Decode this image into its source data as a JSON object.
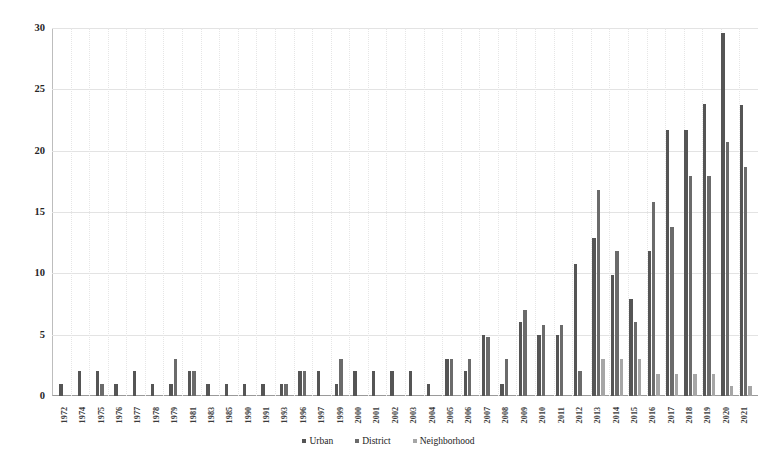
{
  "chart_data": {
    "type": "bar",
    "title": "",
    "xlabel": "",
    "ylabel": "",
    "ylim": [
      0,
      30
    ],
    "yticks": [
      0,
      5,
      10,
      15,
      20,
      25,
      30
    ],
    "grid": true,
    "legend_position": "bottom",
    "categories": [
      "1972",
      "1974",
      "1975",
      "1976",
      "1977",
      "1978",
      "1979",
      "1981",
      "1983",
      "1985",
      "1990",
      "1991",
      "1993",
      "1996",
      "1997",
      "1999",
      "2000",
      "2001",
      "2002",
      "2003",
      "2004",
      "2005",
      "2006",
      "2007",
      "2008",
      "2009",
      "2010",
      "2011",
      "2012",
      "2013",
      "2014",
      "2015",
      "2016",
      "2017",
      "2018",
      "2019",
      "2020",
      "2021"
    ],
    "series": [
      {
        "name": "Urban",
        "color": "#555555",
        "values": [
          1,
          2,
          2,
          1,
          2,
          1,
          1,
          2,
          1,
          1,
          1,
          1,
          1,
          2,
          2,
          1,
          2,
          2,
          2,
          2,
          1,
          3,
          2,
          5,
          1,
          6,
          5,
          5,
          10.8,
          12.9,
          9.9,
          7.9,
          11.8,
          21.7,
          21.7,
          23.8,
          29.6,
          23.7
        ]
      },
      {
        "name": "District",
        "color": "#6b6b6b",
        "values": [
          0,
          0,
          1,
          0,
          0,
          0,
          3,
          2,
          0,
          0,
          0,
          0,
          1,
          2,
          0,
          3,
          0,
          0,
          0,
          0,
          0,
          3,
          3,
          4.8,
          3,
          7,
          5.8,
          5.8,
          2,
          16.8,
          11.8,
          6,
          15.8,
          13.8,
          17.9,
          17.9,
          20.7,
          18.7
        ]
      },
      {
        "name": "Neighborhood",
        "color": "#a6a6a6",
        "values": [
          0,
          0,
          0,
          0,
          0,
          0,
          0,
          0,
          0,
          0,
          0,
          0,
          0,
          0,
          0,
          0,
          0,
          0,
          0,
          0,
          0,
          0,
          0,
          0,
          0,
          0,
          0,
          0,
          0,
          3,
          3,
          3,
          1.8,
          1.8,
          1.8,
          1.8,
          0.8,
          0.8
        ]
      }
    ]
  },
  "legend": {
    "items": [
      {
        "label": "Urban"
      },
      {
        "label": "District"
      },
      {
        "label": "Neighborhood"
      }
    ]
  },
  "caption": {
    "text": ""
  }
}
